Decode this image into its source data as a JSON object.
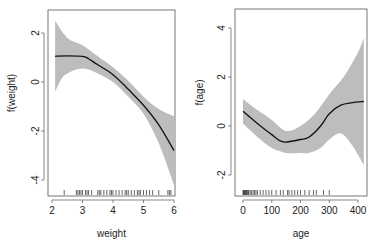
{
  "chart_data": [
    {
      "type": "line",
      "title": "",
      "xlabel": "weight",
      "ylabel": "f(weight)",
      "xlim": [
        1.95,
        6.1
      ],
      "ylim": [
        -4.6,
        3.2
      ],
      "xticks": [
        2,
        3,
        4,
        5,
        6
      ],
      "yticks": [
        2,
        0,
        -2,
        -4
      ],
      "grid": false,
      "legend": null,
      "series": [
        {
          "name": "fit",
          "x": [
            2.1,
            2.5,
            3.0,
            3.2,
            3.5,
            4.0,
            4.5,
            5.0,
            5.5,
            6.0
          ],
          "y": [
            1.05,
            1.07,
            1.05,
            0.95,
            0.7,
            0.3,
            -0.3,
            -0.95,
            -1.75,
            -2.8
          ]
        },
        {
          "name": "upper_band",
          "x": [
            2.1,
            2.5,
            3.0,
            3.5,
            4.0,
            4.5,
            5.0,
            5.5,
            6.0
          ],
          "y": [
            2.5,
            1.8,
            1.5,
            1.05,
            0.6,
            0.05,
            -0.6,
            -1.1,
            -1.4
          ]
        },
        {
          "name": "lower_band",
          "x": [
            2.1,
            2.3,
            2.5,
            3.0,
            3.5,
            4.0,
            4.5,
            5.0,
            5.5,
            6.0
          ],
          "y": [
            -0.4,
            0.1,
            0.35,
            0.55,
            0.35,
            0.0,
            -0.6,
            -1.3,
            -2.5,
            -4.2
          ]
        }
      ],
      "rug": [
        2.4,
        2.8,
        2.85,
        2.9,
        2.95,
        3.0,
        3.1,
        3.15,
        3.2,
        3.3,
        3.5,
        3.55,
        3.6,
        3.7,
        3.8,
        3.9,
        3.95,
        4.0,
        4.1,
        4.2,
        4.3,
        4.4,
        4.45,
        4.5,
        4.6,
        4.7,
        4.8,
        4.85,
        4.9,
        5.0,
        5.1,
        5.2,
        5.3,
        5.5,
        5.8,
        5.85,
        5.9
      ]
    },
    {
      "type": "line",
      "title": "",
      "xlabel": "age",
      "ylabel": "f(age)",
      "xlim": [
        -10,
        430
      ],
      "ylim": [
        -2.8,
        4.8
      ],
      "xticks": [
        0,
        100,
        200,
        300,
        400
      ],
      "yticks": [
        4,
        2,
        0,
        -2
      ],
      "grid": false,
      "legend": null,
      "series": [
        {
          "name": "fit",
          "x": [
            0,
            50,
            100,
            140,
            200,
            230,
            270,
            300,
            340,
            380,
            420
          ],
          "y": [
            0.6,
            0.1,
            -0.35,
            -0.65,
            -0.55,
            -0.45,
            0.0,
            0.5,
            0.85,
            0.95,
            1.0
          ]
        },
        {
          "name": "upper_band",
          "x": [
            0,
            50,
            100,
            150,
            200,
            250,
            300,
            350,
            400,
            420
          ],
          "y": [
            1.1,
            0.65,
            0.25,
            -0.2,
            0.0,
            0.5,
            1.3,
            2.0,
            3.0,
            3.6
          ]
        },
        {
          "name": "lower_band",
          "x": [
            0,
            50,
            100,
            150,
            200,
            230,
            270,
            300,
            340,
            380,
            420
          ],
          "y": [
            0.1,
            -0.45,
            -0.9,
            -1.1,
            -1.1,
            -1.1,
            -0.9,
            -0.55,
            -0.3,
            -0.8,
            -1.6
          ]
        }
      ],
      "rug": [
        0,
        2,
        4,
        6,
        8,
        10,
        12,
        15,
        18,
        20,
        25,
        30,
        35,
        40,
        45,
        50,
        60,
        70,
        80,
        90,
        100,
        115,
        130,
        140,
        155,
        160,
        170,
        180,
        190,
        200,
        215,
        230,
        245,
        255,
        280,
        300
      ]
    }
  ],
  "panels": [
    {
      "xlabel": "weight",
      "ylabel": "f(weight)",
      "xtick_labels": [
        "2",
        "3",
        "4",
        "5",
        "6"
      ],
      "ytick_labels": [
        "2",
        "0",
        "-2",
        "-4"
      ]
    },
    {
      "xlabel": "age",
      "ylabel": "f(age)",
      "xtick_labels": [
        "0",
        "100",
        "200",
        "300",
        "400"
      ],
      "ytick_labels": [
        "4",
        "2",
        "0",
        "-2"
      ]
    }
  ],
  "colors": {
    "band": "#bdbdbd",
    "line": "#111111",
    "axis": "#333333"
  }
}
